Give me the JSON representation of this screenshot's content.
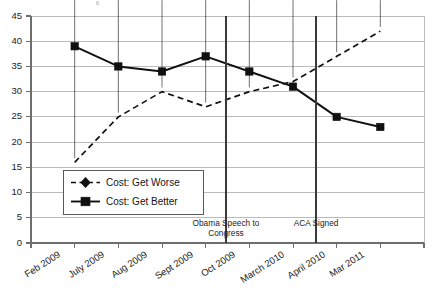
{
  "chart_data": {
    "type": "line",
    "title": "",
    "subtitle": "",
    "xlabel": "",
    "ylabel": "",
    "categories": [
      "Feb 2009",
      "July 2009",
      "Aug 2009",
      "Sept 2009",
      "Oct 2009",
      "March 2010",
      "April 2010",
      "Mar 2011"
    ],
    "series": [
      {
        "name": "Cost: Get Worse",
        "marker": "diamond",
        "linestyle": "dashed",
        "color": "#111111",
        "values": [
          16,
          25,
          30,
          27,
          30,
          32,
          37,
          42
        ]
      },
      {
        "name": "Cost: Get Better",
        "marker": "square",
        "linestyle": "solid",
        "color": "#111111",
        "values": [
          39,
          35,
          34,
          37,
          34,
          31,
          25,
          23
        ]
      }
    ],
    "ylim": [
      0,
      45
    ],
    "ytick_values": [
      0,
      5,
      10,
      15,
      20,
      25,
      30,
      35,
      40,
      45
    ],
    "ytick_labels": [
      "0",
      "5",
      "10",
      "15",
      "20",
      "25",
      "30",
      "35",
      "40",
      "45"
    ],
    "grid": true,
    "grid_axis": "y",
    "legend_position": "center-left-inside",
    "annotations": [
      {
        "name": "obama-speech-marker",
        "label_line_1": "Obama Speech to",
        "label_line_2": "Congress",
        "label_full": "Obama Speech to Congress",
        "x_fraction": 0.4955
      },
      {
        "name": "aca-signed-marker",
        "label_line_1": "ACA Signed",
        "label_line_2": "",
        "label_full": "ACA Signed",
        "x_fraction": 0.7252
      }
    ]
  },
  "legend": {
    "items": [
      {
        "label": "Cost: Get Worse",
        "style": "dashed-diamond"
      },
      {
        "label": "Cost: Get Better",
        "style": "solid-square"
      }
    ]
  },
  "axis": {
    "y_labels": [
      "45",
      "40",
      "35",
      "30",
      "25",
      "20",
      "15",
      "10",
      "5",
      "0"
    ],
    "x_labels": [
      "Feb 2009",
      "July 2009",
      "Aug 2009",
      "Sept 2009",
      "Oct 2009",
      "March 2010",
      "April 2010",
      "Mar 2011"
    ]
  },
  "annotations": {
    "obama": {
      "line1": "Obama Speech to",
      "line2": "Congress"
    },
    "aca": {
      "line1": "ACA Signed",
      "line2": ""
    }
  },
  "colors": {
    "series": "#111111",
    "gridline": "#b4b4b4",
    "axis": "#6e6e6e",
    "event_line": "#3a3a3a",
    "background": "#ffffff"
  }
}
